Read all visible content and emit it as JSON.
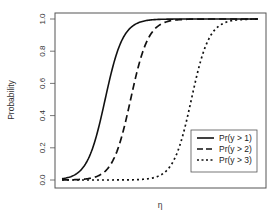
{
  "chart_data": {
    "type": "line",
    "title": "",
    "xlabel": "η",
    "ylabel": "Probability",
    "ylim": [
      0,
      1
    ],
    "yticks": [
      "0.0",
      "0.2",
      "0.4",
      "0.6",
      "0.8",
      "1.0"
    ],
    "xticks": [],
    "grid": false,
    "legend_position": "bottom-right",
    "x": [
      0,
      0.05,
      0.1,
      0.15,
      0.2,
      0.25,
      0.3,
      0.35,
      0.4,
      0.45,
      0.5,
      0.55,
      0.6,
      0.65,
      0.7,
      0.75,
      0.8,
      0.85,
      0.9,
      0.95,
      1.0
    ],
    "series": [
      {
        "name": "Pr(y > 1)",
        "style": "solid",
        "midpoint": 0.22,
        "values": [
          0.01,
          0.03,
          0.08,
          0.2,
          0.42,
          0.66,
          0.84,
          0.93,
          0.97,
          0.99,
          0.995,
          1.0,
          1.0,
          1.0,
          1.0,
          1.0,
          1.0,
          1.0,
          1.0,
          1.0,
          1.0
        ]
      },
      {
        "name": "Pr(y > 2)",
        "style": "dashed",
        "midpoint": 0.35,
        "values": [
          0.0,
          0.005,
          0.01,
          0.03,
          0.07,
          0.17,
          0.35,
          0.58,
          0.78,
          0.9,
          0.96,
          0.985,
          0.995,
          1.0,
          1.0,
          1.0,
          1.0,
          1.0,
          1.0,
          1.0,
          1.0
        ]
      },
      {
        "name": "Pr(y > 3)",
        "style": "dotted",
        "midpoint": 0.66,
        "values": [
          0.0,
          0.0,
          0.0,
          0.0,
          0.0,
          0.0,
          0.0,
          0.0,
          0.005,
          0.01,
          0.02,
          0.05,
          0.12,
          0.3,
          0.55,
          0.77,
          0.9,
          0.96,
          0.985,
          0.995,
          1.0
        ]
      }
    ]
  }
}
